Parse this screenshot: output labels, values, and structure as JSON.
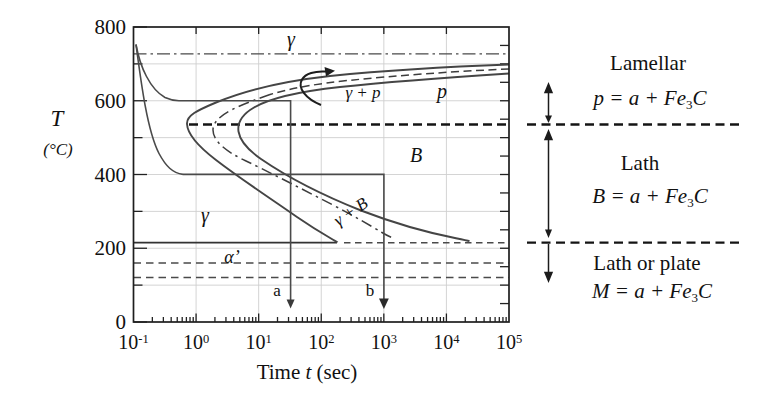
{
  "figure": {
    "y_axis": {
      "label": "T",
      "unit": "(°C)",
      "ticks": [
        800,
        600,
        400,
        200,
        0
      ],
      "minor_ticks": [
        700,
        500,
        300,
        100
      ],
      "range": [
        0,
        800
      ]
    },
    "x_axis": {
      "title_word": "Time",
      "title_var": "t",
      "title_unit": "(sec)",
      "tick_exponents": [
        -1,
        0,
        1,
        2,
        3,
        4,
        5
      ],
      "scale": "log"
    },
    "plot_labels": {
      "gamma_top": "γ",
      "gamma_plus_p": "γ + p",
      "p_region": "p",
      "B_region": "B",
      "gamma_plus_B": "γ + B",
      "gamma_low": "γ",
      "alpha_prime": "α’",
      "path_a": "a",
      "path_b": "b"
    },
    "right_panel": {
      "sections": [
        {
          "name": "Lamellar",
          "pre": "p = a + Fe",
          "sub": "3",
          "post": "C"
        },
        {
          "name": "Lath",
          "pre": "B = a + Fe",
          "sub": "3",
          "post": "C"
        },
        {
          "name": "Lath or plate",
          "pre": "M = a + Fe",
          "sub": "3",
          "post": "C"
        }
      ]
    }
  },
  "chart_data": {
    "type": "line",
    "xlabel": "Time t (sec)",
    "ylabel": "T (°C)",
    "x_scale": "log",
    "xlim": [
      0.1,
      100000
    ],
    "ylim": [
      0,
      800
    ],
    "x_ticks": [
      0.1,
      1,
      10,
      100,
      1000,
      10000,
      100000
    ],
    "y_ticks": [
      0,
      200,
      400,
      600,
      800
    ],
    "grid": "light, every decade and every 100 C",
    "legend_position": "none",
    "horizontal_lines": [
      {
        "name": "eutectoid-A1",
        "T": 727,
        "style": "dash-dot",
        "x_range": [
          0.1,
          100000
        ]
      },
      {
        "name": "pearlite-bainite-boundary",
        "T": 535,
        "style": "bold-dashed",
        "x_range": [
          0.7,
          100000
        ],
        "extends_to_annotation": true
      },
      {
        "name": "Ms",
        "T": 215,
        "style": "solid to t=180 then dashed",
        "x_range": [
          0.1,
          100000
        ],
        "extends_to_annotation": true
      },
      {
        "name": "M-lower-1",
        "T": 160,
        "style": "dashed",
        "x_range": [
          0.1,
          100000
        ]
      },
      {
        "name": "M-lower-2",
        "T": 120,
        "style": "dashed",
        "x_range": [
          0.1,
          100000
        ]
      }
    ],
    "series": [
      {
        "name": "transformation-start",
        "style": "solid",
        "points_t_T": [
          [
            100000,
            698
          ],
          [
            10000,
            691
          ],
          [
            1000,
            680
          ],
          [
            100,
            664
          ],
          [
            22,
            645
          ],
          [
            5,
            615
          ],
          [
            2,
            593
          ],
          [
            0.72,
            539
          ],
          [
            2,
            442
          ],
          [
            5,
            388
          ],
          [
            14,
            339
          ],
          [
            40,
            287
          ],
          [
            95,
            244
          ],
          [
            180,
            216
          ]
        ]
      },
      {
        "name": "transformation-finish",
        "style": "solid",
        "points_t_T": [
          [
            100000,
            673
          ],
          [
            10000,
            664
          ],
          [
            1000,
            650
          ],
          [
            100,
            629
          ],
          [
            8.7,
            583
          ],
          [
            4.7,
            518
          ],
          [
            10,
            444
          ],
          [
            26,
            385
          ],
          [
            420,
            303
          ],
          [
            3800,
            257
          ],
          [
            23000,
            219
          ]
        ]
      },
      {
        "name": "fifty-percent",
        "style": "dashed with arrow",
        "points_t_T": [
          [
            100000,
            686
          ],
          [
            1000,
            664
          ],
          [
            260,
            654
          ],
          [
            1.9,
            523
          ],
          [
            26,
            412
          ],
          [
            140,
            325
          ],
          [
            1450,
            228
          ]
        ]
      },
      {
        "name": "cooling-path-a",
        "style": "thin solid, quench, hold at 600 C, quench, arrow a",
        "points_t_T": [
          [
            0.11,
            751
          ],
          [
            0.5,
            600
          ],
          [
            32,
            600
          ],
          [
            32,
            0
          ]
        ]
      },
      {
        "name": "cooling-path-b",
        "style": "thin solid, quench, hold at 400 C, quench, arrow b",
        "points_t_T": [
          [
            0.11,
            751
          ],
          [
            0.6,
            400
          ],
          [
            1000,
            400
          ],
          [
            1000,
            0
          ]
        ]
      }
    ],
    "annotations": [
      {
        "text": "γ",
        "t": 33,
        "T": 770
      },
      {
        "text": "γ + p",
        "t": 450,
        "T": 620
      },
      {
        "text": "p",
        "t": 8500,
        "T": 625
      },
      {
        "text": "B",
        "t": 3200,
        "T": 452
      },
      {
        "text": "γ + B",
        "t": 300,
        "T": 298,
        "rotation_deg": -34
      },
      {
        "text": "γ",
        "t": 1.4,
        "T": 287
      },
      {
        "text": "α’",
        "t": 3.7,
        "T": 173
      },
      {
        "text": "a",
        "t": 20,
        "T": 84
      },
      {
        "text": "b",
        "t": 600,
        "T": 84
      }
    ]
  }
}
